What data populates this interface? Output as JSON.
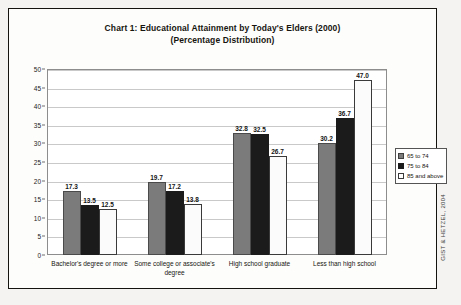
{
  "chart_data": {
    "type": "bar",
    "title": "Chart 1: Educational Attainment by Today's Elders (2000)",
    "subtitle": "(Percentage Distribution)",
    "xlabel": "",
    "ylabel": "",
    "ylim": [
      0,
      50
    ],
    "yticks": [
      0,
      5,
      10,
      15,
      20,
      25,
      30,
      35,
      40,
      45,
      50
    ],
    "grid": true,
    "legend_position": "right",
    "categories": [
      "Bachelor's degree or more",
      "Some college or associate's degree",
      "High school graduate",
      "Less than high school"
    ],
    "series": [
      {
        "name": "65 to 74",
        "color": "#7b7b7b",
        "values": [
          17.3,
          19.7,
          32.8,
          30.2
        ]
      },
      {
        "name": "75 to 84",
        "color": "#1b1b1b",
        "values": [
          13.5,
          17.2,
          32.5,
          36.7
        ]
      },
      {
        "name": "85 and above",
        "color": "#ffffff",
        "values": [
          12.5,
          13.8,
          26.7,
          47.0
        ]
      }
    ],
    "data_labels": [
      "17.3",
      "13.5",
      "12.5",
      "19.7",
      "17.2",
      "13.8",
      "32.8",
      "32.5",
      "26.7",
      "30.2",
      "36.7",
      "47.0"
    ],
    "credit": "GIST & HETZEL, 2004"
  }
}
